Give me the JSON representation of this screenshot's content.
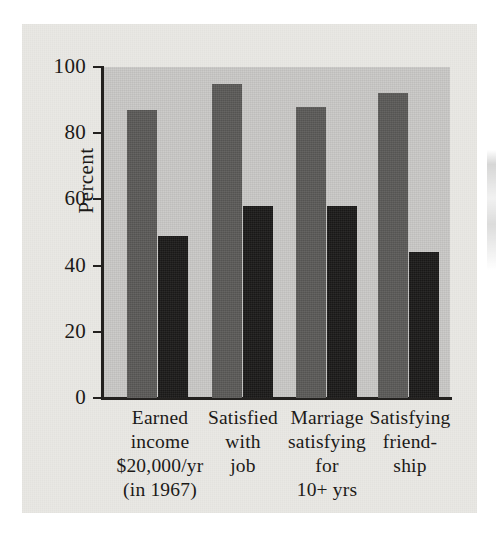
{
  "figure": {
    "kind": "scanned-bar-chart",
    "page_background": "#e9e8e4",
    "plot_background": "#c9c8c6",
    "axis_color": "#23211f"
  },
  "chart_data": {
    "type": "bar",
    "title": "",
    "subtitle": "",
    "xlabel": "",
    "ylabel": "Percent",
    "ylim": [
      0,
      100
    ],
    "yticks": [
      0,
      20,
      40,
      60,
      80,
      100
    ],
    "ytick_labels": [
      "0",
      "20",
      "40",
      "60",
      "80",
      "100"
    ],
    "grid": false,
    "legend_position": "none",
    "categories": [
      "Earned income $20,000/yr (in 1967)",
      "Satisfied with job",
      "Marriage satisfying for 10+ yrs",
      "Satisfying friendship"
    ],
    "category_label_lines": [
      [
        "Earned",
        "income",
        "$20,000/yr",
        "(in 1967)"
      ],
      [
        "Satisfied",
        "with",
        "job"
      ],
      [
        "Marriage",
        "satisfying",
        "for",
        "10+ yrs"
      ],
      [
        "Satisfying",
        "friend-",
        "ship"
      ]
    ],
    "series": [
      {
        "name": "series-a",
        "color": "#5b5a58",
        "values": [
          87,
          95,
          88,
          92
        ]
      },
      {
        "name": "series-b",
        "color": "#1b1a19",
        "values": [
          49,
          58,
          58,
          44
        ]
      }
    ]
  }
}
